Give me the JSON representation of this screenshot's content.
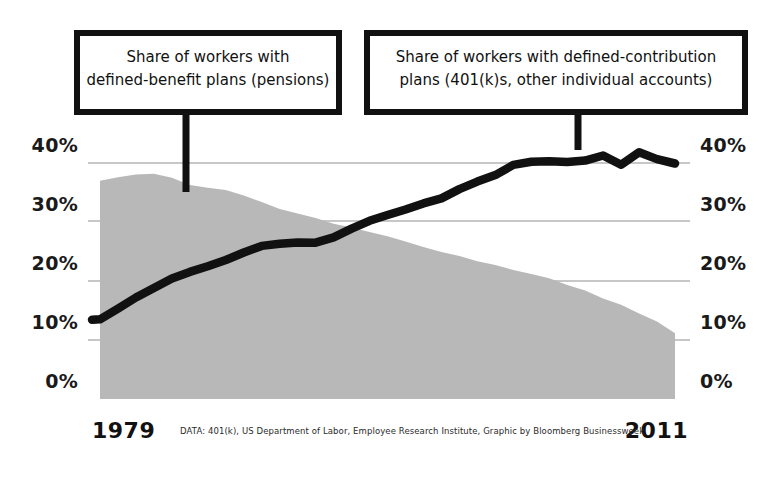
{
  "figure": {
    "background_color": "#ffffff",
    "area_color": "#b8b8b8",
    "line_color": "#111111",
    "grid_color": "#b0b0b0"
  },
  "callouts": [
    {
      "name": "defined-benefit",
      "line1": "Share of workers with",
      "line2": "defined-benefit plans (pensions)"
    },
    {
      "name": "defined-contribution",
      "line1": "Share of workers with defined-contribution",
      "line2": "plans (401(k)s, other individual accounts)"
    }
  ],
  "axis": {
    "y_ticks_left": [
      "40%",
      "30%",
      "20%",
      "10%",
      "0%"
    ],
    "y_ticks_right": [
      "40%",
      "30%",
      "20%",
      "10%",
      "0%"
    ],
    "x_start_label": "1979",
    "x_end_label": "2011"
  },
  "caption": "DATA: 401(k), US Department of Labor, Employee Research Institute, Graphic by Bloomberg Businessweek",
  "chart_data": {
    "type": "area",
    "title": "",
    "xlabel": "",
    "ylabel": "Share of workers",
    "xlim": [
      1979,
      2011
    ],
    "ylim": [
      0,
      45
    ],
    "grid": true,
    "legend": "annotated callouts",
    "x": [
      1979,
      1980,
      1981,
      1982,
      1983,
      1984,
      1985,
      1986,
      1987,
      1988,
      1989,
      1990,
      1991,
      1992,
      1993,
      1994,
      1995,
      1996,
      1997,
      1998,
      1999,
      2000,
      2001,
      2002,
      2003,
      2004,
      2005,
      2006,
      2007,
      2008,
      2009,
      2010,
      2011
    ],
    "series": [
      {
        "name": "Share of workers with defined-benefit plans (pensions)",
        "render": "area",
        "color": "#b8b8b8",
        "values": [
          37.0,
          37.6,
          38.0,
          38.2,
          37.6,
          36.3,
          35.8,
          35.5,
          34.6,
          33.3,
          32.3,
          31.4,
          30.6,
          29.8,
          29.0,
          28.3,
          27.5,
          26.6,
          25.8,
          25.0,
          24.3,
          23.4,
          22.6,
          21.9,
          21.2,
          20.4,
          19.4,
          18.3,
          17.1,
          15.9,
          14.4,
          13.2,
          11.2
        ]
      },
      {
        "name": "Share of workers with defined-contribution plans (401(k)s, other individual accounts)",
        "render": "line",
        "color": "#111111",
        "values": [
          13.6,
          15.4,
          17.3,
          18.9,
          20.3,
          21.5,
          22.4,
          23.6,
          24.8,
          25.9,
          26.4,
          26.5,
          26.6,
          27.4,
          28.8,
          30.2,
          31.2,
          32.1,
          33.1,
          34.1,
          35.6,
          36.8,
          38.0,
          39.7,
          40.2,
          40.3,
          40.1,
          40.3,
          41.3,
          39.7,
          41.8,
          40.6,
          39.9
        ]
      }
    ]
  }
}
